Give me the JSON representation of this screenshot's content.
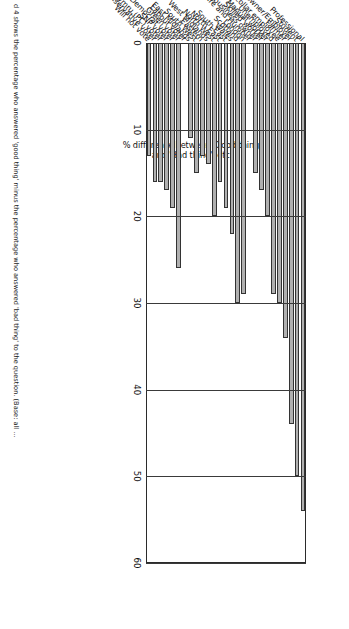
{
  "figure": {
    "orientation_note": "page-rotated",
    "caption": "d 4 shows the percentage who answered 'good thing' minus the percentage who answered 'bad thing' to the question. (Base: all ...",
    "axis": {
      "ylabel_line1": "% difference between 'Good thing'",
      "ylabel_line2": "and 'Bad thing', etc.",
      "ticks": [
        "0",
        "10",
        "20",
        "30",
        "40",
        "50",
        "60"
      ],
      "min": 0,
      "max": 60
    }
  },
  "chart_data": {
    "type": "bar",
    "title": "",
    "xlabel": "",
    "ylabel": "% difference between 'Good thing' and 'Bad thing', etc.",
    "ylim": [
      0,
      60
    ],
    "grid": true,
    "legend": "none",
    "bar_color": "#b0b0b0",
    "categories": [
      "Professional",
      "Student",
      "Owner/Employer",
      "Farmer",
      "White-collar employee",
      "Unemployed",
      "Manual worker",
      "Skilled worker",
      "Small business owner",
      "Yorkshire and Humber",
      "London",
      "Scotland",
      "Wales",
      "South East",
      "North East",
      "North West",
      "West Midlands",
      "Eastern",
      "South West",
      "East Midlands",
      "Labour voter",
      "Green voter",
      "Liberal Democrat voter",
      "SNP voter",
      "Plaid Cymru (PC) voter",
      "Conservative voter",
      "Will not vote"
    ],
    "values": [
      54,
      50,
      44,
      34,
      30,
      29,
      20,
      17,
      15,
      0,
      29,
      30,
      22,
      19,
      16,
      20,
      14,
      13,
      15,
      11,
      0,
      26,
      19,
      17,
      16,
      16,
      13
    ],
    "groups": [
      {
        "name": "Occupation",
        "from": 0,
        "to": 8
      },
      {
        "name": "Region",
        "from": 10,
        "to": 19
      },
      {
        "name": "Vote intention",
        "from": 21,
        "to": 26
      }
    ]
  }
}
